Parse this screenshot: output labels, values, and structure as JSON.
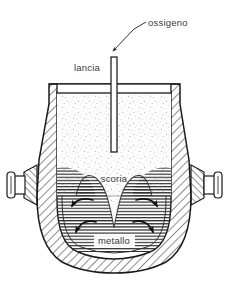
{
  "diagram": {
    "labels": {
      "oxygen": "ossigeno",
      "lance": "lancia",
      "slag": "scoria",
      "metal": "metallo"
    },
    "colors": {
      "outline": "#1a1a1a",
      "hatch": "#2b2b2b",
      "text": "#3a3a3a",
      "background": "#ffffff",
      "slag_fill": "#fbfbfb",
      "metal_fill": "#f0f0f0",
      "arrow": "#111111"
    },
    "label_positions": {
      "oxygen": {
        "x": 148,
        "y": 26
      },
      "lance": {
        "x": 74,
        "y": 71
      },
      "slag": {
        "x": 100,
        "y": 182
      },
      "metal": {
        "x": 98,
        "y": 244
      }
    },
    "leader_line": {
      "from_x": 112,
      "from_y": 51,
      "bend_x": 134,
      "bend_y": 29,
      "to_x": 146,
      "to_y": 22,
      "arrowhead": "down-left"
    },
    "lance": {
      "center_x": 114,
      "top_y": 57,
      "tip_y": 152,
      "width": 6
    },
    "flow_arrows": [
      {
        "side": "left",
        "index": 1,
        "direction": "counter-clockwise"
      },
      {
        "side": "left",
        "index": 2,
        "direction": "counter-clockwise"
      },
      {
        "side": "right",
        "index": 1,
        "direction": "clockwise"
      },
      {
        "side": "right",
        "index": 2,
        "direction": "clockwise"
      }
    ],
    "parts": [
      "refractory-shell",
      "vessel-mouth-rim",
      "left-trunnion",
      "right-trunnion",
      "slag-layer",
      "metal-bath",
      "oxygen-lance"
    ]
  }
}
